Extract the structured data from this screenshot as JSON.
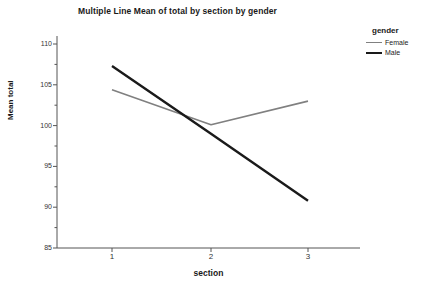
{
  "chart_data": {
    "type": "line",
    "title": "Multiple Line Mean of total by section by gender",
    "xlabel": "section",
    "ylabel": "Mean total",
    "categories": [
      "1",
      "2",
      "3"
    ],
    "x": [
      1,
      2,
      3
    ],
    "series": [
      {
        "name": "Female",
        "values": [
          104.4,
          100.1,
          103.0
        ],
        "color": "#808080",
        "line_width": 1.6
      },
      {
        "name": "Male",
        "values": [
          107.3,
          99.0,
          90.8
        ],
        "color": "#1a1a1a",
        "line_width": 2.4
      }
    ],
    "ylim": [
      85,
      110
    ],
    "xlim": [
      0.5,
      3.5
    ],
    "yticks": [
      85,
      90,
      95,
      100,
      105,
      110
    ],
    "ytick_labels": [
      "85",
      "90",
      "95",
      "100",
      "105",
      "110"
    ],
    "yminor_ticks": [
      87.5,
      92.5,
      97.5,
      102.5,
      107.5
    ],
    "xticks": [
      1,
      2,
      3
    ],
    "xtick_labels": [
      "1",
      "2",
      "3"
    ],
    "grid": false,
    "legend_position": "right",
    "legend_title": "gender",
    "markers": false
  },
  "legend": {
    "title": "gender",
    "entries": [
      {
        "label": "Female",
        "color": "#808080",
        "width": 1.6
      },
      {
        "label": "Male",
        "color": "#1a1a1a",
        "width": 2.4
      }
    ]
  },
  "axes": {
    "axis_color": "#555555",
    "background": "#ffffff"
  }
}
